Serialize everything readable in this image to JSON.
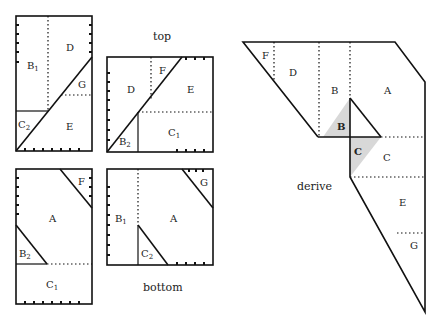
{
  "captions": {
    "top": "top",
    "bottom": "bottom",
    "derive": "derive"
  },
  "panel_top_left": {
    "labels": {
      "B1": "B",
      "B1_sub": "1",
      "D": "D",
      "G": "G",
      "C2": "C",
      "C2_sub": "2",
      "E": "E"
    }
  },
  "panel_top_right": {
    "labels": {
      "D": "D",
      "F": "F",
      "E": "E",
      "B2": "B",
      "B2_sub": "2",
      "C1": "C",
      "C1_sub": "1"
    }
  },
  "panel_bottom_left": {
    "labels": {
      "F": "F",
      "A": "A",
      "B2": "B",
      "B2_sub": "2",
      "C1": "C",
      "C1_sub": "1"
    }
  },
  "panel_bottom_right": {
    "labels": {
      "G": "G",
      "B1": "B",
      "B1_sub": "1",
      "A": "A",
      "C2": "C",
      "C2_sub": "2"
    }
  },
  "derive_figure": {
    "labels": {
      "F": "F",
      "D": "D",
      "B": "B",
      "A": "A",
      "B_shaded": "B",
      "C_shaded": "C",
      "C": "C",
      "E": "E",
      "G": "G"
    },
    "shade_color": "#d8d8d8"
  }
}
